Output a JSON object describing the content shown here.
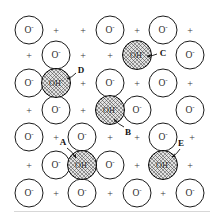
{
  "figure": {
    "name": "ionic-lattice-hydroxyl-defects",
    "width": 220,
    "height": 222,
    "background_color": "#ffffff",
    "baseline_color": "#d7d7d7"
  },
  "legend_symbols": {
    "anion_label": "O",
    "anion_superscript": "-",
    "hydroxyl_label": "OH",
    "hydroxyl_superscript": "-",
    "cation_label": "+"
  },
  "colors": {
    "anion_stroke": "#1a1a1a",
    "anion_fill": "#ffffff",
    "hydroxyl_stroke": "#000000",
    "hydroxyl_fill": "#e3e3e3",
    "hatch_color": "#3c3c3c",
    "text_color": "#2b2b2b",
    "callout_color": "#111111"
  },
  "lattice": {
    "columns_x": [
      29,
      56,
      82,
      110,
      137,
      163,
      190
    ],
    "rows_y": [
      30,
      55,
      83,
      110,
      137,
      165,
      193
    ],
    "sites": [
      {
        "type": "anion",
        "x": 29,
        "y": 30,
        "label": "O",
        "sup": "-"
      },
      {
        "type": "cation",
        "x": 56,
        "y": 31,
        "label": "+"
      },
      {
        "type": "cation",
        "x": 83,
        "y": 31,
        "label": "+"
      },
      {
        "type": "anion",
        "x": 110,
        "y": 30,
        "label": "O",
        "sup": "-"
      },
      {
        "type": "cation",
        "x": 137,
        "y": 31,
        "label": "+"
      },
      {
        "type": "anion",
        "x": 163,
        "y": 30,
        "label": "O",
        "sup": "-"
      },
      {
        "type": "cation",
        "x": 190,
        "y": 31,
        "label": "+"
      },
      {
        "type": "cation",
        "x": 29,
        "y": 56,
        "label": "+"
      },
      {
        "type": "anion",
        "x": 56,
        "y": 55,
        "label": "O",
        "sup": "-"
      },
      {
        "type": "cation",
        "x": 83,
        "y": 56,
        "label": "+"
      },
      {
        "type": "cation",
        "x": 110,
        "y": 56,
        "label": "+"
      },
      {
        "type": "hydroxyl",
        "x": 137,
        "y": 55,
        "label": "OH",
        "sup": "-"
      },
      {
        "type": "anion",
        "x": 190,
        "y": 55,
        "label": "O",
        "sup": "-"
      },
      {
        "type": "anion",
        "x": 29,
        "y": 83,
        "label": "O",
        "sup": "-"
      },
      {
        "type": "hydroxyl",
        "x": 56,
        "y": 83,
        "label": "OH",
        "sup": "-"
      },
      {
        "type": "cation",
        "x": 83,
        "y": 84,
        "label": "+"
      },
      {
        "type": "anion",
        "x": 110,
        "y": 83,
        "label": "O",
        "sup": "-"
      },
      {
        "type": "cation",
        "x": 137,
        "y": 84,
        "label": "+"
      },
      {
        "type": "anion",
        "x": 163,
        "y": 83,
        "label": "O",
        "sup": "-"
      },
      {
        "type": "cation",
        "x": 190,
        "y": 84,
        "label": "+"
      },
      {
        "type": "cation",
        "x": 29,
        "y": 111,
        "label": "+"
      },
      {
        "type": "anion",
        "x": 56,
        "y": 110,
        "label": "O",
        "sup": "-"
      },
      {
        "type": "cation",
        "x": 83,
        "y": 111,
        "label": "+"
      },
      {
        "type": "hydroxyl",
        "x": 110,
        "y": 110,
        "label": "OH",
        "sup": "-"
      },
      {
        "type": "anion",
        "x": 137,
        "y": 110,
        "label": "O",
        "sup": "-"
      },
      {
        "type": "anion",
        "x": 190,
        "y": 110,
        "label": "O",
        "sup": "-"
      },
      {
        "type": "anion",
        "x": 29,
        "y": 137,
        "label": "O",
        "sup": "-"
      },
      {
        "type": "cation",
        "x": 56,
        "y": 138,
        "label": "+"
      },
      {
        "type": "anion",
        "x": 82,
        "y": 137,
        "label": "O",
        "sup": "-"
      },
      {
        "type": "cation",
        "x": 110,
        "y": 138,
        "label": "+"
      },
      {
        "type": "cation",
        "x": 137,
        "y": 138,
        "label": "+"
      },
      {
        "type": "anion",
        "x": 163,
        "y": 137,
        "label": "O",
        "sup": "-"
      },
      {
        "type": "cation",
        "x": 192,
        "y": 138,
        "label": "+"
      },
      {
        "type": "cation",
        "x": 29,
        "y": 166,
        "label": "+"
      },
      {
        "type": "anion",
        "x": 56,
        "y": 165,
        "label": "O",
        "sup": "-"
      },
      {
        "type": "hydroxyl",
        "x": 82,
        "y": 165,
        "label": "OH",
        "sup": "-"
      },
      {
        "type": "anion",
        "x": 110,
        "y": 165,
        "label": "O",
        "sup": "-"
      },
      {
        "type": "cation",
        "x": 137,
        "y": 166,
        "label": "+"
      },
      {
        "type": "hydroxyl",
        "x": 163,
        "y": 165,
        "label": "OH",
        "sup": "-"
      },
      {
        "type": "cation",
        "x": 190,
        "y": 166,
        "label": "+"
      },
      {
        "type": "anion",
        "x": 29,
        "y": 193,
        "label": "O",
        "sup": "-"
      },
      {
        "type": "cation",
        "x": 56,
        "y": 194,
        "label": "+"
      },
      {
        "type": "anion",
        "x": 82,
        "y": 193,
        "label": "O",
        "sup": "-"
      },
      {
        "type": "cation",
        "x": 110,
        "y": 194,
        "label": "+"
      },
      {
        "type": "anion",
        "x": 137,
        "y": 193,
        "label": "O",
        "sup": "-"
      },
      {
        "type": "cation",
        "x": 163,
        "y": 194,
        "label": "+"
      },
      {
        "type": "anion",
        "x": 190,
        "y": 193,
        "label": "O",
        "sup": "-"
      }
    ]
  },
  "callouts": [
    {
      "id": "A",
      "label": "A",
      "x": 63,
      "y": 142,
      "arrow_from": {
        "x": 67,
        "y": 148
      },
      "arrow_to": {
        "x": 76,
        "y": 158
      }
    },
    {
      "id": "B",
      "label": "B",
      "x": 128,
      "y": 132,
      "arrow_from": {
        "x": 124,
        "y": 127
      },
      "arrow_to": {
        "x": 114,
        "y": 119
      }
    },
    {
      "id": "C",
      "label": "C",
      "x": 163,
      "y": 53,
      "arrow_from": {
        "x": 157,
        "y": 54
      },
      "arrow_to": {
        "x": 147,
        "y": 56
      }
    },
    {
      "id": "D",
      "label": "D",
      "x": 81,
      "y": 70,
      "arrow_from": {
        "x": 76,
        "y": 73
      },
      "arrow_to": {
        "x": 67,
        "y": 79
      }
    },
    {
      "id": "E",
      "label": "E",
      "x": 181,
      "y": 143,
      "arrow_from": {
        "x": 180,
        "y": 149
      },
      "arrow_to": {
        "x": 172,
        "y": 157
      }
    }
  ]
}
